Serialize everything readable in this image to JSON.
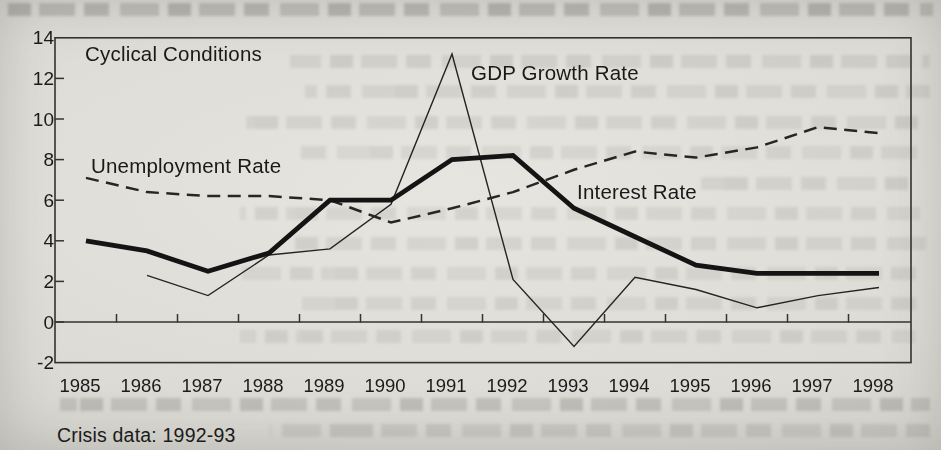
{
  "chart_data": {
    "type": "line",
    "title": "Cyclical Conditions",
    "note": "Crisis data: 1992-93",
    "x": [
      1985,
      1986,
      1987,
      1988,
      1989,
      1990,
      1991,
      1992,
      1993,
      1994,
      1995,
      1996,
      1997,
      1998
    ],
    "x_tick_labels": [
      "1985",
      "1986",
      "1987",
      "1988",
      "1989",
      "1990",
      "1991",
      "1992",
      "1993",
      "1994",
      "1995",
      "1996",
      "1997",
      "1998"
    ],
    "y_ticks": [
      14,
      12,
      10,
      8,
      6,
      4,
      2,
      0,
      -2
    ],
    "y_tick_labels": [
      "14",
      "12",
      "10",
      "8",
      "6",
      "4",
      "2",
      "0",
      "-2"
    ],
    "ylim": [
      -2,
      14
    ],
    "grid": false,
    "legend_position": "inline-labels",
    "ink_color": "#1a1a1a",
    "paper_color": "#dcdbd5",
    "series": [
      {
        "name": "GDP Growth Rate",
        "style": "thin-solid",
        "values": [
          null,
          2.3,
          1.3,
          3.3,
          3.6,
          5.8,
          13.2,
          2.1,
          -1.2,
          2.2,
          1.6,
          0.7,
          1.3,
          1.7
        ]
      },
      {
        "name": "Unemployment Rate",
        "style": "dashed",
        "values": [
          7.1,
          6.4,
          6.2,
          6.2,
          6.0,
          4.9,
          5.6,
          6.4,
          7.5,
          8.4,
          8.1,
          8.6,
          9.6,
          9.3
        ]
      },
      {
        "name": "Interest Rate",
        "style": "thick-solid",
        "values": [
          4.0,
          3.5,
          2.5,
          3.4,
          6.0,
          6.0,
          8.0,
          8.2,
          5.6,
          4.2,
          2.8,
          2.4,
          2.4,
          2.4
        ]
      }
    ]
  }
}
